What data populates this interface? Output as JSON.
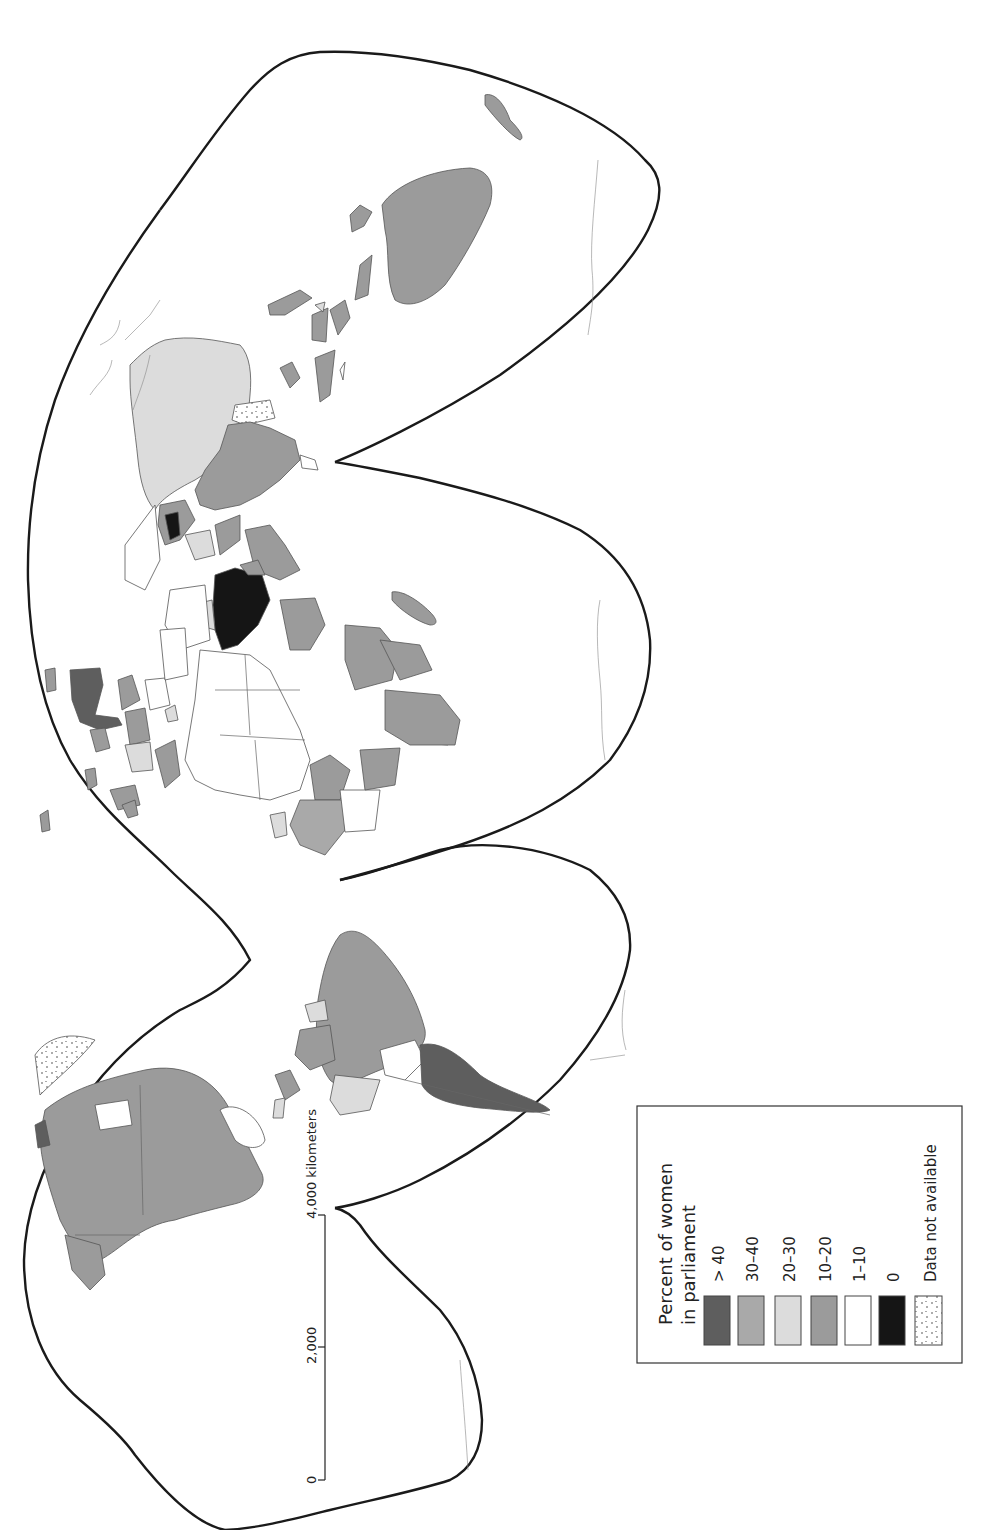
{
  "map": {
    "title": "Percent of women in parliament",
    "orientation": "rotated 90 degrees; north points left",
    "projection": "interrupted (Goode-like homolosine), 3 northern / 3 southern lobes"
  },
  "legend": {
    "title_line1": "Percent of women",
    "title_line2": "in parliament",
    "items": [
      {
        "label": "> 40",
        "color": "#5e5e5e",
        "pattern": "solid"
      },
      {
        "label": "30–40",
        "color": "#a9a9a9",
        "pattern": "solid"
      },
      {
        "label": "20–30",
        "color": "#dcdcdc",
        "pattern": "solid"
      },
      {
        "label": "10–20",
        "color": "#9b9b9b",
        "pattern": "solid"
      },
      {
        "label": "1–10",
        "color": "#ffffff",
        "pattern": "solid"
      },
      {
        "label": "0",
        "color": "#151515",
        "pattern": "solid"
      },
      {
        "label": "Data not available",
        "color": "#ffffff",
        "pattern": "stipple"
      }
    ]
  },
  "scale_bar": {
    "ticks": [
      "0",
      "2,000",
      "4,000 kilometers"
    ],
    "unit": "kilometers"
  },
  "regions": [
    {
      "name": "North America (USA, Canada)",
      "category": "10–20"
    },
    {
      "name": "Greenland",
      "category": "Data not available"
    },
    {
      "name": "Mexico / Central America",
      "category": "10–20"
    },
    {
      "name": "Brazil",
      "category": "10–20"
    },
    {
      "name": "Argentina",
      "category": "> 40"
    },
    {
      "name": "Paraguay / Bolivia region",
      "category": "1–10"
    },
    {
      "name": "Peru",
      "category": "20–30"
    },
    {
      "name": "Nordic countries",
      "category": "> 40"
    },
    {
      "name": "Western Europe (various)",
      "category": "20–30"
    },
    {
      "name": "Saudi Arabia",
      "category": "0"
    },
    {
      "name": "Kyrgyzstan region",
      "category": "0"
    },
    {
      "name": "Russia",
      "category": "20–30"
    },
    {
      "name": "China",
      "category": "10–20"
    },
    {
      "name": "Mongolia",
      "category": "Data not available"
    },
    {
      "name": "Australia",
      "category": "10–20"
    },
    {
      "name": "North Africa (Algeria, Libya, Egypt)",
      "category": "1–10"
    },
    {
      "name": "Southern Africa (South Africa, Mozambique)",
      "category": "30–40"
    },
    {
      "name": "East Africa (Tanzania, Uganda)",
      "category": "20–30"
    },
    {
      "name": "Madagascar",
      "category": "10–20"
    }
  ]
}
